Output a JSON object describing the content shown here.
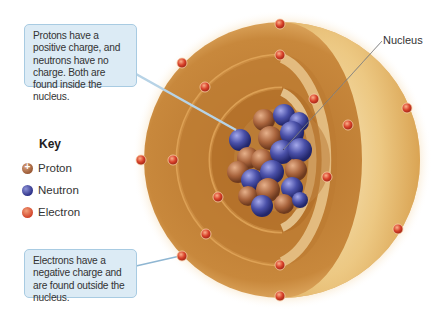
{
  "callouts": {
    "protons_neutrons": "Protons have a positive charge, and neutrons have no charge. Both are found inside the nucleus.",
    "electrons": "Electrons have a negative charge and are found outside the nucleus."
  },
  "labels": {
    "nucleus": "Nucleus"
  },
  "key": {
    "title": "Key",
    "items": [
      {
        "label": "Proton",
        "icon": "proton-icon",
        "color": "#a8633c"
      },
      {
        "label": "Neutron",
        "icon": "neutron-icon",
        "color": "#3a3f93"
      },
      {
        "label": "Electron",
        "icon": "electron-icon",
        "color": "#e05a3a"
      }
    ]
  },
  "colors": {
    "shell_outer": "#c98a3a",
    "shell_light": "#f3d9a0",
    "callout_fill": "#dcebf5",
    "callout_border": "#a8cbe2"
  }
}
